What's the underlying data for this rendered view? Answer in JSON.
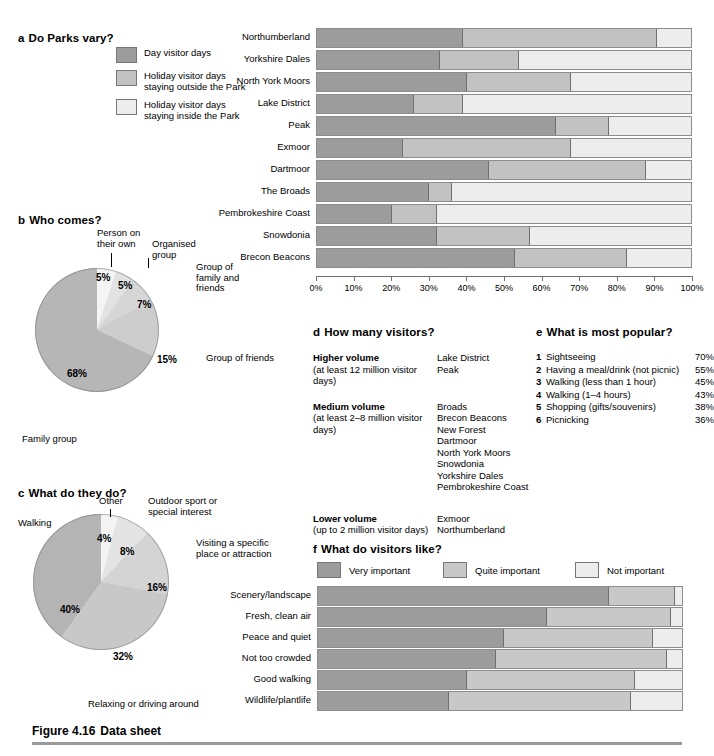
{
  "figure": {
    "number": "Figure 4.16",
    "title": "Data sheet"
  },
  "panel_a": {
    "letter": "a",
    "title": "Do Parks vary?",
    "legend": [
      {
        "label": "Day visitor days",
        "color": "#9c9c9c"
      },
      {
        "label": "Holiday visitor days staying outside the Park",
        "color": "#c2c2c2"
      },
      {
        "label": "Holiday visitor days staying inside the Park",
        "color": "#ededed"
      }
    ],
    "axis_ticks": [
      "0%",
      "10%",
      "20%",
      "30%",
      "40%",
      "50%",
      "60%",
      "70%",
      "80%",
      "90%",
      "100%"
    ],
    "chart_data": {
      "type": "bar",
      "orientation": "horizontal",
      "stacked": true,
      "title": "Do Parks vary?",
      "xlabel": "",
      "ylabel": "",
      "xlim": [
        0,
        100
      ],
      "grid": false,
      "legend_position": "left",
      "categories": [
        "Northumberland",
        "Yorkshire Dales",
        "North York Moors",
        "Lake District",
        "Peak",
        "Exmoor",
        "Dartmoor",
        "The Broads",
        "Pembrokeshire Coast",
        "Snowdonia",
        "Brecon Beacons"
      ],
      "series": [
        {
          "name": "Day visitor days",
          "color": "#9c9c9c",
          "values": [
            39,
            33,
            40,
            26,
            64,
            23,
            46,
            30,
            20,
            32,
            53
          ]
        },
        {
          "name": "Holiday visitor days staying outside the Park",
          "color": "#c2c2c2",
          "values": [
            52,
            21,
            28,
            13,
            14,
            45,
            42,
            6,
            12,
            25,
            30
          ]
        },
        {
          "name": "Holiday visitor days staying inside the Park",
          "color": "#ededed",
          "values": [
            9,
            46,
            32,
            61,
            22,
            32,
            12,
            64,
            68,
            43,
            17
          ]
        }
      ]
    }
  },
  "panel_b": {
    "letter": "b",
    "title": "Who comes?",
    "chart_data": {
      "type": "pie",
      "title": "Who comes?",
      "labels": [
        "Person on their own",
        "Organised group",
        "Group of family and friends",
        "Group of friends",
        "Family group"
      ],
      "values": [
        5,
        5,
        7,
        15,
        68
      ],
      "value_labels": [
        "5%",
        "5%",
        "7%",
        "15%",
        "68%"
      ],
      "colors": [
        "#f4f4f4",
        "#e2e2e2",
        "#d6d6d6",
        "#cdcdcd",
        "#b6b6b6"
      ]
    },
    "labels": {
      "person_own": "Person on\ntheir own",
      "organised_group": "Organised\ngroup",
      "family_friends": "Group of\nfamily and\nfriends",
      "friends": "Group of friends",
      "family_group": "Family group"
    },
    "label_person_own_l1": "Person on",
    "label_person_own_l2": "their own",
    "label_organised_l1": "Organised",
    "label_organised_l2": "group",
    "label_famfriends_l1": "Group of",
    "label_famfriends_l2": "family and",
    "label_famfriends_l3": "friends",
    "label_friends": "Group of friends",
    "label_familygroup": "Family group",
    "pct_person_own": "5%",
    "pct_organised": "5%",
    "pct_famfriends": "7%",
    "pct_friends": "15%",
    "pct_familygroup": "68%"
  },
  "panel_c": {
    "letter": "c",
    "title": "What do they do?",
    "chart_data": {
      "type": "pie",
      "title": "What do they do?",
      "labels": [
        "Other",
        "Outdoor sport or special interest",
        "Visiting a specific place or attraction",
        "Relaxing or driving around",
        "Walking"
      ],
      "values": [
        4,
        8,
        16,
        32,
        40
      ],
      "value_labels": [
        "4%",
        "8%",
        "16%",
        "32%",
        "40%"
      ],
      "colors": [
        "#f4f4f4",
        "#e4e4e4",
        "#d4d4d4",
        "#c8c8c8",
        "#b4b4b4"
      ]
    },
    "label_other": "Other",
    "label_outdoor_l1": "Outdoor sport or",
    "label_outdoor_l2": "special interest",
    "label_visiting_l1": "Visiting a specific",
    "label_visiting_l2": "place or attraction",
    "label_relaxing": "Relaxing or driving around",
    "label_walking": "Walking",
    "pct_other": "4%",
    "pct_outdoor": "8%",
    "pct_visiting": "16%",
    "pct_relaxing": "32%",
    "pct_walking": "40%"
  },
  "panel_d": {
    "letter": "d",
    "title": "How many visitors?",
    "groups": [
      {
        "heading": "Higher volume",
        "subheading": "(at least 12 million visitor days)",
        "parks": [
          "Lake District",
          "Peak"
        ]
      },
      {
        "heading": "Medium volume",
        "subheading": "(at least 2–8 million visitor days)",
        "parks": [
          "Broads",
          "Brecon Beacons",
          "New Forest",
          "Dartmoor",
          "North York Moors",
          "Snowdonia",
          "Yorkshire Dales",
          "Pembrokeshire Coast"
        ]
      },
      {
        "heading": "Lower volume",
        "subheading": "(up to 2 million visitor days)",
        "parks": [
          "Exmoor",
          "Northumberland"
        ]
      }
    ]
  },
  "panel_e": {
    "letter": "e",
    "title": "What is most popular?",
    "chart_data": {
      "type": "table",
      "title": "What is most popular?",
      "columns": [
        "Rank",
        "Activity",
        "Percentage"
      ],
      "rows": [
        [
          "1",
          "Sightseeing",
          "70%"
        ],
        [
          "2",
          "Having a meal/drink (not picnic)",
          "55%"
        ],
        [
          "3",
          "Walking (less than 1 hour)",
          "45%"
        ],
        [
          "4",
          "Walking (1–4 hours)",
          "43%"
        ],
        [
          "5",
          "Shopping (gifts/souvenirs)",
          "38%"
        ],
        [
          "6",
          "Picnicking",
          "36%"
        ]
      ]
    },
    "items": [
      {
        "rank": "1",
        "name": "Sightseeing",
        "value": "70%"
      },
      {
        "rank": "2",
        "name": "Having a meal/drink (not picnic)",
        "value": "55%"
      },
      {
        "rank": "3",
        "name": "Walking (less than 1 hour)",
        "value": "45%"
      },
      {
        "rank": "4",
        "name": "Walking (1–4 hours)",
        "value": "43%"
      },
      {
        "rank": "5",
        "name": "Shopping (gifts/souvenirs)",
        "value": "38%"
      },
      {
        "rank": "6",
        "name": "Picnicking",
        "value": "36%"
      }
    ]
  },
  "panel_f": {
    "letter": "f",
    "title": "What do visitors like?",
    "legend": [
      {
        "label": "Very important",
        "color": "#9c9c9c"
      },
      {
        "label": "Quite important",
        "color": "#c8c8c8"
      },
      {
        "label": "Not important",
        "color": "#ededed"
      }
    ],
    "chart_data": {
      "type": "bar",
      "orientation": "horizontal",
      "stacked": true,
      "title": "What do visitors like?",
      "xlabel": "",
      "ylabel": "",
      "xlim": [
        0,
        100
      ],
      "grid": false,
      "legend_position": "top",
      "categories": [
        "Scenery/landscape",
        "Fresh, clean air",
        "Peace and quiet",
        "Not too crowded",
        "Good walking",
        "Wildlife/plantlife"
      ],
      "series": [
        {
          "name": "Very important",
          "color": "#9c9c9c",
          "values": [
            80,
            63,
            51,
            49,
            41,
            36
          ]
        },
        {
          "name": "Quite important",
          "color": "#c8c8c8",
          "values": [
            18,
            34,
            41,
            47,
            46,
            50
          ]
        },
        {
          "name": "Not important",
          "color": "#ededed",
          "values": [
            2,
            3,
            8,
            4,
            13,
            14
          ]
        }
      ]
    }
  }
}
